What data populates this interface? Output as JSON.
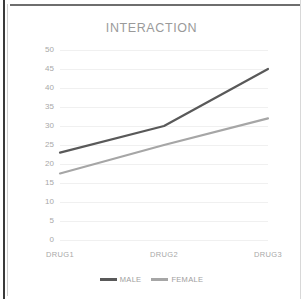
{
  "chart_data": {
    "type": "line",
    "title": "INTERACTION",
    "xlabel": "",
    "ylabel": "",
    "categories": [
      "DRUG1",
      "DRUG2",
      "DRUG3"
    ],
    "series": [
      {
        "name": "MALE",
        "values": [
          23,
          30,
          45
        ],
        "color": "#595959"
      },
      {
        "name": "FEMALE",
        "values": [
          17.5,
          25,
          32
        ],
        "color": "#a6a6a6"
      }
    ],
    "ylim": [
      0,
      50
    ],
    "yticks": [
      50,
      45,
      40,
      35,
      30,
      25,
      20,
      15,
      10,
      5,
      0
    ],
    "ytick_labels": [
      "50",
      "45",
      "40",
      "35",
      "30",
      "25",
      "20",
      "15",
      "10",
      "5",
      "0"
    ],
    "grid": true,
    "markers": false,
    "legend_position": "bottom"
  },
  "legend": {
    "entries": [
      {
        "label": "MALE",
        "color": "#595959"
      },
      {
        "label": "FEMALE",
        "color": "#a6a6a6"
      }
    ]
  },
  "colors": {
    "male_line": "#595959",
    "female_line": "#a6a6a6",
    "title_text": "#9a9a9a",
    "tick_text": "#a8a8a8",
    "gridline": "#f0f0f0",
    "border": "#3a3a3a"
  }
}
